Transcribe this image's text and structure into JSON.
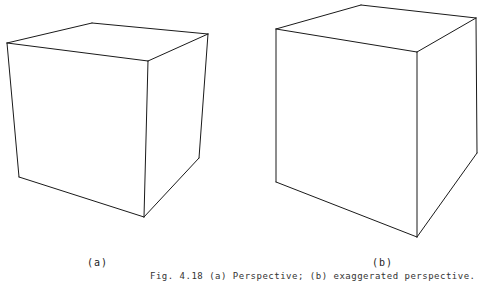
{
  "figure": {
    "caption": "Fig. 4.18  (a) Perspective; (b) exaggerated perspective.",
    "panels": [
      {
        "label": "(a)",
        "description": "cube in normal perspective",
        "edges": [
          [
            92,
            23,
            7,
            43
          ],
          [
            92,
            23,
            208,
            34
          ],
          [
            7,
            43,
            148,
            61
          ],
          [
            208,
            34,
            148,
            61
          ],
          [
            7,
            43,
            19,
            177
          ],
          [
            148,
            61,
            144,
            217
          ],
          [
            208,
            34,
            199,
            158
          ],
          [
            19,
            177,
            144,
            217
          ],
          [
            144,
            217,
            199,
            158
          ]
        ]
      },
      {
        "label": "(b)",
        "description": "cube in exaggerated perspective",
        "edges": [
          [
            361,
            5,
            276,
            29
          ],
          [
            361,
            5,
            476,
            18
          ],
          [
            276,
            29,
            417,
            52
          ],
          [
            476,
            18,
            417,
            52
          ],
          [
            276,
            29,
            276,
            182
          ],
          [
            417,
            52,
            417,
            237
          ],
          [
            476,
            18,
            477,
            153
          ],
          [
            276,
            182,
            417,
            237
          ],
          [
            417,
            237,
            477,
            153
          ]
        ]
      }
    ],
    "line_color": "#1a1a1a"
  }
}
